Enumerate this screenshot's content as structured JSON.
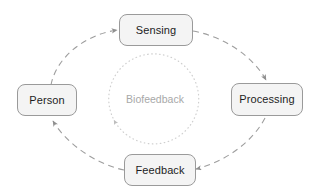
{
  "diagram": {
    "center_label": "Biofeedback",
    "nodes": [
      {
        "id": "sensing",
        "label": "Sensing",
        "position": "top"
      },
      {
        "id": "processing",
        "label": "Processing",
        "position": "right"
      },
      {
        "id": "feedback",
        "label": "Feedback",
        "position": "bottom"
      },
      {
        "id": "person",
        "label": "Person",
        "position": "left"
      }
    ],
    "edges": [
      {
        "id": "person-to-sensing",
        "from": "Person",
        "to": "Sensing",
        "style": "dashed",
        "direction": "clockwise"
      },
      {
        "id": "sensing-to-processing",
        "from": "Sensing",
        "to": "Processing",
        "style": "dashed",
        "direction": "clockwise"
      },
      {
        "id": "processing-to-feedback",
        "from": "Processing",
        "to": "Feedback",
        "style": "dashed",
        "direction": "clockwise"
      },
      {
        "id": "feedback-to-person",
        "from": "Feedback",
        "to": "Person",
        "style": "dashed",
        "direction": "clockwise"
      }
    ],
    "inner_loop": {
      "label": "Biofeedback",
      "style": "dotted",
      "direction": "counter-clockwise"
    },
    "colors": {
      "background": "#ffffff",
      "node_fill": "#f4f4f4",
      "node_border": "#9a9a9a",
      "node_text": "#1d1d1d",
      "edge": "#9e9e9e",
      "inner_circle": "#cfcfcf",
      "center_text": "#a8a8a8"
    }
  }
}
